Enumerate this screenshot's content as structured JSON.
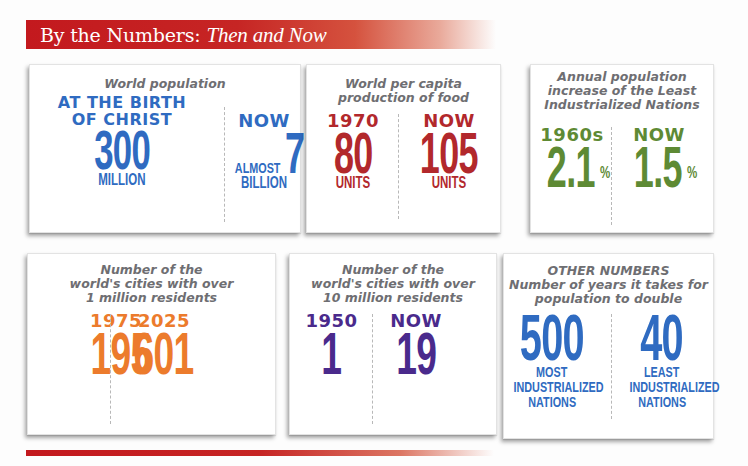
{
  "header": {
    "title": "By the Numbers:",
    "subtitle": "Then and Now"
  },
  "colors": {
    "banner_red": "#c3191e",
    "blue": "#2f6bc1",
    "red": "#b2282c",
    "green": "#5e8a34",
    "orange": "#ec7b2c",
    "purple": "#4a2a8c",
    "title_gray": "#6e6e72"
  },
  "cards": [
    {
      "title": "World population",
      "left": {
        "label": "AT THE BIRTH OF CHRIST",
        "label_line1": "AT THE BIRTH",
        "label_line2": "OF CHRIST",
        "value": "300",
        "unit": "MILLION"
      },
      "right": {
        "label": "NOW",
        "prefix": "ALMOST",
        "value": "7",
        "unit": "BILLION"
      }
    },
    {
      "title": "World per capita production of food",
      "title_line1": "World per capita",
      "title_line2": "production of food",
      "left": {
        "label": "1970",
        "value": "80",
        "unit": "UNITS"
      },
      "right": {
        "label": "NOW",
        "value": "105",
        "unit": "UNITS"
      }
    },
    {
      "title": "Annual population increase of the Least Industrialized Nations",
      "title_line1": "Annual population",
      "title_line2": "increase of the Least",
      "title_line3": "Industrialized Nations",
      "left": {
        "label": "1960s",
        "value": "2.1",
        "suffix": "%"
      },
      "right": {
        "label": "NOW",
        "value": "1.5",
        "suffix": "%"
      }
    },
    {
      "title": "Number of the world's cities with over 1 million residents",
      "title_line1": "Number of the",
      "title_line2": "world's cities with over",
      "title_line3": "1 million residents",
      "left": {
        "label": "1975",
        "value": "195"
      },
      "right": {
        "label": "2025",
        "value": "601"
      }
    },
    {
      "title": "Number of the world's cities with over 10 million residents",
      "title_line1": "Number of the",
      "title_line2": "world's cities with over",
      "title_line3": "10 million residents",
      "left": {
        "label": "1950",
        "value": "1"
      },
      "right": {
        "label": "NOW",
        "value": "19"
      }
    },
    {
      "heading": "OTHER NUMBERS",
      "title": "Number of years it takes for population to double",
      "title_line1": "Number of years it takes for",
      "title_line2": "population to double",
      "left": {
        "value": "500",
        "unit_line1": "MOST",
        "unit_line2": "INDUSTRIALIZED",
        "unit_line3": "NATIONS"
      },
      "right": {
        "value": "40",
        "unit_line1": "LEAST",
        "unit_line2": "INDUSTRIALIZED",
        "unit_line3": "NATIONS"
      }
    }
  ]
}
